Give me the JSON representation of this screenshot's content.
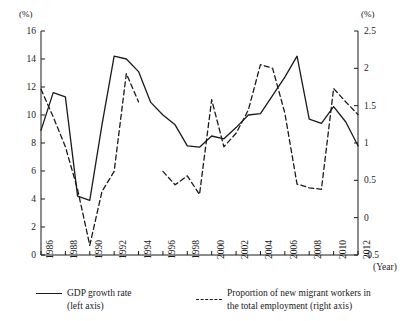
{
  "chart_data": {
    "type": "line",
    "title": "",
    "xlabel": "(Year)",
    "ylabel_left": "(%)",
    "ylabel_right": "(%)",
    "grid": false,
    "legend_position": "below",
    "x": [
      1986,
      1987,
      1988,
      1989,
      1990,
      1991,
      1992,
      1993,
      1994,
      1995,
      1996,
      1997,
      1998,
      1999,
      2000,
      2001,
      2002,
      2003,
      2004,
      2005,
      2006,
      2007,
      2008,
      2009,
      2010,
      2011,
      2012
    ],
    "xtick_labels": [
      "1986",
      "1988",
      "1990",
      "1992",
      "1994",
      "1996",
      "1998",
      "2000",
      "2002",
      "2004",
      "2006",
      "2008",
      "2010",
      "2012"
    ],
    "xlim": [
      1986,
      2012
    ],
    "ylim_left": [
      0,
      16
    ],
    "ytick_labels_left": [
      "0",
      "2",
      "4",
      "6",
      "8",
      "10",
      "12",
      "14",
      "16"
    ],
    "ytick_values_left": [
      0,
      2,
      4,
      6,
      8,
      10,
      12,
      14,
      16
    ],
    "ylim_right": [
      -0.5,
      2.5
    ],
    "ytick_labels_right": [
      "-0.5",
      "0",
      "0.5",
      "1",
      "1.5",
      "2",
      "2.5"
    ],
    "ytick_values_right": [
      -0.5,
      0,
      0.5,
      1,
      1.5,
      2,
      2.5
    ],
    "series": [
      {
        "name": "GDP growth rate (left axis)",
        "axis": "left",
        "style": "solid",
        "color": "#1a1a1a",
        "values": [
          8.9,
          11.6,
          11.3,
          4.2,
          3.9,
          9.3,
          14.2,
          14.0,
          13.1,
          10.9,
          10.0,
          9.3,
          7.8,
          7.7,
          8.5,
          8.3,
          9.1,
          10.0,
          10.1,
          11.4,
          12.7,
          14.2,
          9.7,
          9.4,
          10.6,
          9.5,
          7.8
        ]
      },
      {
        "name": "Proportion of new migrant workers in the total employment (right axis)",
        "axis": "right",
        "style": "dashed",
        "color": "#1a1a1a",
        "values": [
          1.72,
          1.35,
          0.95,
          0.38,
          -0.37,
          0.35,
          0.62,
          1.93,
          1.55,
          null,
          0.62,
          0.44,
          0.56,
          0.31,
          1.58,
          0.95,
          1.13,
          1.44,
          2.05,
          2.0,
          1.4,
          0.45,
          0.4,
          0.38,
          1.73,
          1.55,
          1.38
        ]
      }
    ]
  },
  "legend": {
    "solid_label": "GDP growth rate",
    "solid_sub": "(left axis)",
    "dashed_label": "Proportion of new migrant workers in",
    "dashed_sub": "the total employment (right axis)"
  },
  "axis_captions": {
    "unit_left": "(%)",
    "unit_right": "(%)",
    "year": "(Year)"
  }
}
